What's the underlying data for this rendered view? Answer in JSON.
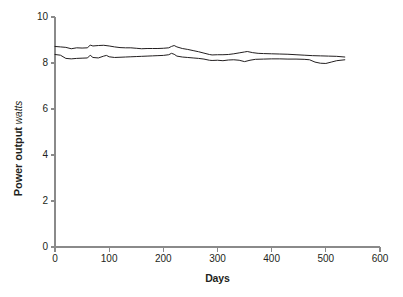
{
  "chart_data": {
    "type": "line",
    "title": "",
    "xlabel": "Days",
    "ylabel": "Power output",
    "ylabel_unit": "watts",
    "xlim": [
      0,
      600
    ],
    "ylim": [
      0,
      10
    ],
    "xticks": [
      0,
      100,
      200,
      300,
      400,
      500,
      600
    ],
    "yticks": [
      0,
      2,
      4,
      6,
      8,
      10
    ],
    "xtick_labels": [
      "0",
      "100",
      "200",
      "300",
      "400",
      "500",
      "600"
    ],
    "ytick_labels": [
      "0",
      "2",
      "4",
      "6",
      "8",
      "10"
    ],
    "grid": false,
    "legend": false,
    "line_color": "#231f20",
    "axis_color": "#8a8a8a",
    "background": "#ffffff",
    "series": [
      {
        "name": "upper",
        "color": "#231f20",
        "x": [
          0,
          10,
          20,
          30,
          40,
          50,
          60,
          65,
          70,
          80,
          90,
          100,
          110,
          120,
          130,
          140,
          150,
          160,
          170,
          180,
          190,
          200,
          210,
          215,
          220,
          225,
          235,
          245,
          255,
          265,
          275,
          285,
          290,
          300,
          310,
          320,
          330,
          340,
          350,
          355,
          365,
          375,
          385,
          400,
          415,
          430,
          445,
          460,
          475,
          490,
          505,
          520,
          535
        ],
        "y": [
          8.72,
          8.7,
          8.68,
          8.62,
          8.66,
          8.65,
          8.66,
          8.78,
          8.74,
          8.76,
          8.77,
          8.74,
          8.7,
          8.67,
          8.66,
          8.66,
          8.64,
          8.62,
          8.63,
          8.63,
          8.63,
          8.64,
          8.66,
          8.72,
          8.76,
          8.7,
          8.63,
          8.59,
          8.54,
          8.49,
          8.43,
          8.37,
          8.35,
          8.36,
          8.36,
          8.37,
          8.4,
          8.44,
          8.48,
          8.5,
          8.45,
          8.42,
          8.41,
          8.4,
          8.39,
          8.38,
          8.36,
          8.34,
          8.32,
          8.31,
          8.3,
          8.29,
          8.26
        ]
      },
      {
        "name": "lower",
        "color": "#231f20",
        "x": [
          0,
          10,
          20,
          30,
          40,
          50,
          60,
          65,
          70,
          80,
          90,
          95,
          100,
          110,
          120,
          130,
          140,
          150,
          160,
          170,
          180,
          190,
          200,
          210,
          215,
          220,
          225,
          235,
          245,
          255,
          265,
          275,
          285,
          290,
          300,
          310,
          320,
          330,
          340,
          350,
          360,
          370,
          385,
          400,
          415,
          430,
          445,
          460,
          470,
          480,
          490,
          500,
          510,
          520,
          535
        ],
        "y": [
          8.37,
          8.34,
          8.2,
          8.18,
          8.2,
          8.21,
          8.22,
          8.34,
          8.24,
          8.22,
          8.3,
          8.33,
          8.27,
          8.24,
          8.25,
          8.26,
          8.27,
          8.28,
          8.29,
          8.3,
          8.31,
          8.32,
          8.33,
          8.36,
          8.42,
          8.38,
          8.3,
          8.26,
          8.24,
          8.22,
          8.2,
          8.17,
          8.12,
          8.11,
          8.12,
          8.1,
          8.13,
          8.14,
          8.12,
          8.06,
          8.12,
          8.16,
          8.17,
          8.18,
          8.18,
          8.17,
          8.17,
          8.16,
          8.14,
          8.04,
          7.99,
          7.98,
          8.04,
          8.1,
          8.14
        ]
      }
    ]
  },
  "axes": {
    "plot_left_px": 55,
    "plot_right_px": 380,
    "plot_top_px": 17,
    "plot_bottom_px": 247
  }
}
